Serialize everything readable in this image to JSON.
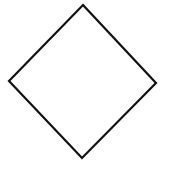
{
  "diagram": {
    "shape": "diamond",
    "stroke_color": "#111111",
    "fill_color": "#ffffff",
    "background": "#ffffff",
    "vertices": {
      "top": [
        83,
        5
      ],
      "right": [
        156,
        83
      ],
      "bottom": [
        82,
        158
      ],
      "left": [
        9,
        81
      ]
    },
    "stroke_width": 2.2
  }
}
